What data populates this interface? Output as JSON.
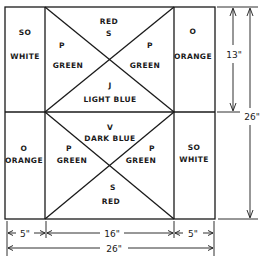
{
  "diagram": {
    "type": "flag-layout",
    "panels": {
      "top_left": {
        "code": "SO",
        "color_name": "WHITE"
      },
      "top_right": {
        "code": "O",
        "color_name": "ORANGE"
      },
      "bottom_left": {
        "code": "O",
        "color_name": "ORANGE"
      },
      "bottom_right": {
        "code": "SO",
        "color_name": "WHITE"
      },
      "top_center": {
        "top": {
          "code": "S",
          "color_name": "RED"
        },
        "left": {
          "code": "P",
          "color_name": "GREEN"
        },
        "right": {
          "code": "P",
          "color_name": "GREEN"
        },
        "bottom": {
          "code": "J",
          "color_name": "LIGHT BLUE"
        }
      },
      "bottom_center": {
        "top": {
          "code": "V",
          "color_name": "DARK BLUE"
        },
        "left": {
          "code": "P",
          "color_name": "GREEN"
        },
        "right": {
          "code": "P",
          "color_name": "GREEN"
        },
        "bottom": {
          "code": "S",
          "color_name": "RED"
        }
      }
    },
    "dimensions": {
      "half_height": "13\"",
      "total_height": "26\"",
      "left_width": "5\"",
      "center_width": "16\"",
      "right_width": "5\"",
      "total_width": "26\""
    }
  }
}
